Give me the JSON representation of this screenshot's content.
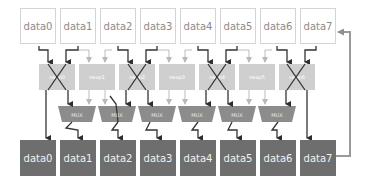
{
  "diagram": {
    "type": "shuffle-network",
    "inputs": [
      "data0",
      "data1",
      "data2",
      "data3",
      "data4",
      "data5",
      "data6",
      "data7"
    ],
    "swaps": [
      {
        "label": "swap0",
        "active": true
      },
      {
        "label": "swap1",
        "active": false
      },
      {
        "label": "swap2",
        "active": true
      },
      {
        "label": "swap3",
        "active": false
      },
      {
        "label": "swap4",
        "active": true
      },
      {
        "label": "swap5",
        "active": false
      },
      {
        "label": "swap6",
        "active": true
      }
    ],
    "muxes": [
      "MUX",
      "MUX",
      "MUX",
      "MUX",
      "MUX",
      "MUX"
    ],
    "outputs": [
      "data0",
      "data1",
      "data2",
      "data3",
      "data4",
      "data5",
      "data6",
      "data7"
    ],
    "feedback": {
      "from": "data7",
      "to": "data7"
    },
    "colors": {
      "input_border": "#d4d4d4",
      "input_text": "#8a8a8a",
      "swap_fill": "#cfcfcf",
      "mux_fill": "#8c8c8c",
      "output_fill": "#6e6e6e",
      "wire_active": "#3a3a3a",
      "wire_inactive": "#bdbdbd",
      "feedback_wire": "#9a9a9a"
    }
  }
}
